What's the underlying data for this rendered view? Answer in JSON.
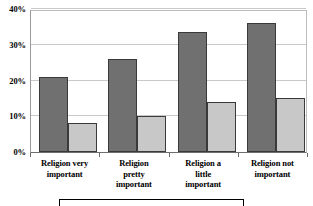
{
  "chart_data": {
    "type": "bar",
    "title": "",
    "subtitle": "",
    "xlabel": "",
    "ylabel": "",
    "ylim": [
      0,
      40
    ],
    "ytick_labels": [
      "0%",
      "10%",
      "20%",
      "30%",
      "40%"
    ],
    "ytick_values": [
      0,
      10,
      20,
      30,
      40
    ],
    "grid": true,
    "legend_position": "bottom",
    "categories": [
      "Religion very important",
      "Religion pretty important",
      "Religion a little important",
      "Religion not important"
    ],
    "series": [
      {
        "name": "Series 1",
        "color": "#707070",
        "values": [
          21,
          26,
          33.5,
          36
        ]
      },
      {
        "name": "Series 2",
        "color": "#c8c8c8",
        "values": [
          8,
          10,
          14,
          15
        ]
      }
    ]
  },
  "axis": {
    "y_ticks": [
      {
        "label": "40%",
        "value": 40
      },
      {
        "label": "30%",
        "value": 30
      },
      {
        "label": "20%",
        "value": 20
      },
      {
        "label": "10%",
        "value": 10
      },
      {
        "label": "0%",
        "value": 0
      }
    ],
    "x_categories": [
      {
        "line1": "Religion very",
        "line2": "important",
        "line3": ""
      },
      {
        "line1": "Religion",
        "line2": "pretty",
        "line3": "important"
      },
      {
        "line1": "Religion a",
        "line2": "little",
        "line3": "important"
      },
      {
        "line1": "Religion not",
        "line2": "important",
        "line3": ""
      }
    ]
  },
  "legend": {
    "entries": [
      {
        "label": "",
        "color": "#707070"
      },
      {
        "label": "",
        "color": "#c8c8c8"
      }
    ]
  },
  "colors": {
    "series_dark": "#707070",
    "series_light": "#c8c8c8",
    "gridline": "#c9c9c9",
    "axis": "#6e6e6e",
    "bar_outline": "#3a3a3a"
  }
}
